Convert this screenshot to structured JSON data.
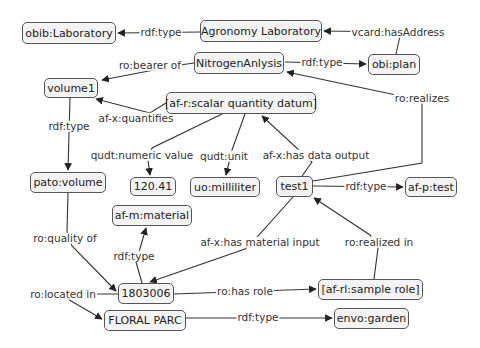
{
  "diagram": {
    "type": "concept-map",
    "nodes": [
      {
        "id": "obib_laboratory",
        "label": "obib:Laboratory",
        "x": 22,
        "y": 22,
        "w": 94,
        "h": 22
      },
      {
        "id": "agronomy_laboratory",
        "label": "Agronomy Laboratory",
        "x": 200,
        "y": 20,
        "w": 122,
        "h": 22
      },
      {
        "id": "obi_plan",
        "label": "obi:plan",
        "x": 368,
        "y": 54,
        "w": 52,
        "h": 21
      },
      {
        "id": "nitrogen_anlysis",
        "label": "NitrogenAnlysis",
        "x": 194,
        "y": 52,
        "w": 90,
        "h": 22
      },
      {
        "id": "volume1",
        "label": "volume1",
        "x": 44,
        "y": 78,
        "w": 54,
        "h": 20
      },
      {
        "id": "scalar_quantity_datum",
        "label": "[af-r:scalar quantity datum]",
        "x": 166,
        "y": 92,
        "w": 150,
        "h": 22
      },
      {
        "id": "pato_volume",
        "label": "pato:volume",
        "x": 30,
        "y": 172,
        "w": 76,
        "h": 21
      },
      {
        "id": "value_120_41",
        "label": "120.41",
        "x": 130,
        "y": 177,
        "w": 46,
        "h": 19
      },
      {
        "id": "uo_milliliter",
        "label": "uo:milliliter",
        "x": 190,
        "y": 177,
        "w": 70,
        "h": 20
      },
      {
        "id": "test1",
        "label": "test1",
        "x": 276,
        "y": 176,
        "w": 37,
        "h": 21
      },
      {
        "id": "af_p_test",
        "label": "af-p:test",
        "x": 405,
        "y": 177,
        "w": 52,
        "h": 20
      },
      {
        "id": "af_m_material",
        "label": "af-m:material",
        "x": 112,
        "y": 205,
        "w": 80,
        "h": 21
      },
      {
        "id": "sample_1803006",
        "label": "1803006",
        "x": 118,
        "y": 283,
        "w": 56,
        "h": 21
      },
      {
        "id": "floral_parc",
        "label": "FLORAL PARC",
        "x": 104,
        "y": 310,
        "w": 82,
        "h": 21
      },
      {
        "id": "sample_role",
        "label": "[af-rl:sample role]",
        "x": 318,
        "y": 279,
        "w": 105,
        "h": 21
      },
      {
        "id": "envo_garden",
        "label": "envo:garden",
        "x": 334,
        "y": 308,
        "w": 75,
        "h": 21
      }
    ],
    "edges": [
      {
        "id": "e1",
        "label": "rdf:type",
        "from": "agronomy_laboratory",
        "to": "obib_laboratory",
        "lx": 161,
        "ly": 32
      },
      {
        "id": "e2",
        "label": "vcard:hasAddress",
        "from": "obi_plan",
        "to": "agronomy_laboratory",
        "lx": 398,
        "ly": 32
      },
      {
        "id": "e3",
        "label": "rdf:type",
        "from": "nitrogen_anlysis",
        "to": "obi_plan",
        "lx": 320,
        "ly": 62
      },
      {
        "id": "e4",
        "label": "ro:bearer of",
        "from": "nitrogen_anlysis",
        "to": "volume1",
        "lx": 150,
        "ly": 65
      },
      {
        "id": "e5",
        "label": "ro:realizes",
        "from": "test1",
        "to": "nitrogen_anlysis",
        "lx": 420,
        "ly": 98
      },
      {
        "id": "e6",
        "label": "af-x:quantifies",
        "from": "scalar_quantity_datum",
        "to": "volume1",
        "lx": 136,
        "ly": 118
      },
      {
        "id": "e7",
        "label": "rdf:type",
        "from": "volume1",
        "to": "pato_volume",
        "lx": 69,
        "ly": 126
      },
      {
        "id": "e8",
        "label": "qudt:numeric value",
        "from": "scalar_quantity_datum",
        "to": "value_120_41",
        "lx": 142,
        "ly": 155
      },
      {
        "id": "e9",
        "label": "qudt:unit",
        "from": "scalar_quantity_datum",
        "to": "uo_milliliter",
        "lx": 224,
        "ly": 155
      },
      {
        "id": "e10",
        "label": "af-x:has data output",
        "from": "test1",
        "to": "scalar_quantity_datum",
        "lx": 316,
        "ly": 155
      },
      {
        "id": "e11",
        "label": "rdf:type",
        "from": "test1",
        "to": "af_p_test",
        "lx": 366,
        "ly": 186
      },
      {
        "id": "e12",
        "label": "ro:quality of",
        "from": "pato_volume",
        "to": "sample_1803006",
        "lx": 65,
        "ly": 238
      },
      {
        "id": "e13",
        "label": "rdf:type",
        "from": "sample_1803006",
        "to": "af_m_material",
        "lx": 128,
        "ly": 255
      },
      {
        "id": "e14",
        "label": "af-x:has material input",
        "from": "test1",
        "to": "sample_1803006",
        "lx": 260,
        "ly": 242
      },
      {
        "id": "e15",
        "label": "ro:realized in",
        "from": "sample_role",
        "to": "test1",
        "lx": 378,
        "ly": 242
      },
      {
        "id": "e16",
        "label": "ro:located in",
        "from": "sample_1803006",
        "to": "floral_parc",
        "lx": 63,
        "ly": 294
      },
      {
        "id": "e17",
        "label": "ro:has role",
        "from": "sample_1803006",
        "to": "sample_role",
        "lx": 245,
        "ly": 291
      },
      {
        "id": "e18",
        "label": "rdf:type",
        "from": "floral_parc",
        "to": "envo_garden",
        "lx": 258,
        "ly": 317
      }
    ],
    "colors": {
      "node_fill": "#f3f3f3",
      "node_border": "#555555",
      "edge": "#333333",
      "background": "#ffffff"
    }
  }
}
